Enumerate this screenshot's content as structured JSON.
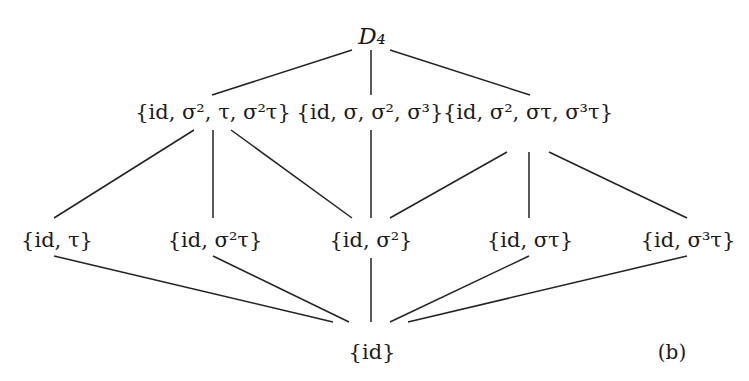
{
  "diagram": {
    "panel_label": "(b)",
    "line_color": "#222222",
    "nodes": [
      {
        "id": "D4",
        "label": "D₄",
        "x": 372,
        "y": 36
      },
      {
        "id": "klein_tau",
        "label": "{id, σ², τ, σ²τ}",
        "x": 213,
        "y": 112
      },
      {
        "id": "cyclic4",
        "label": "{id, σ, σ², σ³}",
        "x": 370,
        "y": 112
      },
      {
        "id": "klein_sigmatau",
        "label": "{id, σ², στ, σ³τ}",
        "x": 528,
        "y": 112
      },
      {
        "id": "tau",
        "label": "{id, τ}",
        "x": 57,
        "y": 240
      },
      {
        "id": "sigma2tau",
        "label": "{id, σ²τ}",
        "x": 215,
        "y": 240
      },
      {
        "id": "sigma2",
        "label": "{id, σ²}",
        "x": 371,
        "y": 240
      },
      {
        "id": "sigmatau",
        "label": "{id, στ}",
        "x": 530,
        "y": 240
      },
      {
        "id": "sigma3tau",
        "label": "{id, σ³τ}",
        "x": 688,
        "y": 240
      },
      {
        "id": "trivial",
        "label": "{id}",
        "x": 372,
        "y": 352
      }
    ],
    "edges": [
      {
        "from": "D4",
        "to": "klein_tau",
        "x1": 352,
        "y1": 50,
        "x2": 212,
        "y2": 95
      },
      {
        "from": "D4",
        "to": "cyclic4",
        "x1": 371,
        "y1": 50,
        "x2": 371,
        "y2": 95
      },
      {
        "from": "D4",
        "to": "klein_sigmatau",
        "x1": 390,
        "y1": 50,
        "x2": 530,
        "y2": 95
      },
      {
        "from": "klein_tau",
        "to": "tau",
        "x1": 194,
        "y1": 130,
        "x2": 54,
        "y2": 218
      },
      {
        "from": "klein_tau",
        "to": "sigma2tau",
        "x1": 213,
        "y1": 130,
        "x2": 213,
        "y2": 218
      },
      {
        "from": "klein_tau",
        "to": "sigma2",
        "x1": 231,
        "y1": 130,
        "x2": 352,
        "y2": 218
      },
      {
        "from": "cyclic4",
        "to": "sigma2",
        "x1": 371,
        "y1": 130,
        "x2": 371,
        "y2": 218
      },
      {
        "from": "klein_sigmatau",
        "to": "sigma2",
        "x1": 507,
        "y1": 152,
        "x2": 390,
        "y2": 218
      },
      {
        "from": "klein_sigmatau",
        "to": "sigmatau",
        "x1": 529,
        "y1": 152,
        "x2": 529,
        "y2": 218
      },
      {
        "from": "klein_sigmatau",
        "to": "sigma3tau",
        "x1": 549,
        "y1": 152,
        "x2": 687,
        "y2": 218
      },
      {
        "from": "tau",
        "to": "trivial",
        "x1": 54,
        "y1": 256,
        "x2": 333,
        "y2": 322
      },
      {
        "from": "sigma2tau",
        "to": "trivial",
        "x1": 213,
        "y1": 256,
        "x2": 349,
        "y2": 322
      },
      {
        "from": "sigma2",
        "to": "trivial",
        "x1": 371,
        "y1": 258,
        "x2": 371,
        "y2": 322
      },
      {
        "from": "sigmatau",
        "to": "trivial",
        "x1": 529,
        "y1": 256,
        "x2": 390,
        "y2": 322
      },
      {
        "from": "sigma3tau",
        "to": "trivial",
        "x1": 687,
        "y1": 256,
        "x2": 408,
        "y2": 322
      }
    ],
    "tag_position": {
      "x": 672,
      "y": 352
    }
  }
}
